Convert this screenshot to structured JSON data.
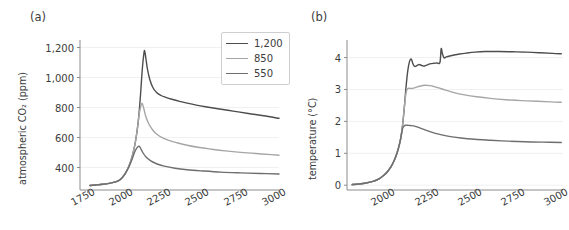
{
  "figure": {
    "panels": [
      {
        "tag": "(a)",
        "ylabel": "atmospheric CO₂ (ppm)",
        "xlabel": ""
      },
      {
        "tag": "(b)",
        "ylabel": "temperature (°C)",
        "xlabel": ""
      }
    ]
  },
  "legend": {
    "entries": [
      {
        "label": "1,200",
        "color": "#4d4d4d"
      },
      {
        "label": "850",
        "color": "#a6a6a6"
      },
      {
        "label": "550",
        "color": "#6e6e6e"
      }
    ]
  },
  "colors": {
    "series_1200": "#4d4d4d",
    "series_850": "#a6a6a6",
    "series_550": "#6e6e6e",
    "axis": "#8c8c8c",
    "grid": "#f0f0f0",
    "text": "#3c3c3c",
    "background": "#ffffff"
  },
  "chart_data": [
    {
      "type": "line",
      "panel": "(a)",
      "title": "",
      "xlabel": "",
      "ylabel": "atmospheric CO2 (ppm)",
      "xlim": [
        1700,
        3000
      ],
      "ylim": [
        250,
        1250
      ],
      "xticks": [
        1750,
        2000,
        2250,
        2500,
        2750,
        3000
      ],
      "yticks": [
        400,
        600,
        800,
        1000,
        1200
      ],
      "ytick_labels": [
        "400",
        "600",
        "800",
        "1,000",
        "1,200"
      ],
      "xtick_labels": [
        "1750",
        "2000",
        "2250",
        "2500",
        "2750",
        "3000"
      ],
      "grid": true,
      "legend_position": "upper right",
      "series": [
        {
          "name": "1,200",
          "color": "#4d4d4d",
          "x": [
            1765,
            1800,
            1850,
            1900,
            1950,
            1980,
            2000,
            2020,
            2040,
            2060,
            2080,
            2095,
            2105,
            2115,
            2122,
            2130,
            2140,
            2155,
            2175,
            2200,
            2230,
            2260,
            2300,
            2350,
            2400,
            2460,
            2520,
            2600,
            2700,
            2800,
            2900,
            3000
          ],
          "y": [
            280,
            283,
            288,
            296,
            311,
            338,
            368,
            410,
            470,
            560,
            700,
            880,
            1030,
            1140,
            1180,
            1130,
            1060,
            990,
            935,
            900,
            880,
            868,
            855,
            841,
            829,
            816,
            805,
            792,
            776,
            760,
            745,
            728
          ]
        },
        {
          "name": "850",
          "color": "#a6a6a6",
          "x": [
            1765,
            1800,
            1850,
            1900,
            1950,
            1980,
            2000,
            2020,
            2040,
            2060,
            2075,
            2085,
            2095,
            2105,
            2115,
            2130,
            2150,
            2175,
            2200,
            2240,
            2280,
            2330,
            2400,
            2480,
            2560,
            2650,
            2750,
            2850,
            2950,
            3000
          ],
          "y": [
            280,
            283,
            288,
            296,
            311,
            338,
            368,
            410,
            470,
            560,
            660,
            745,
            800,
            828,
            800,
            740,
            690,
            650,
            623,
            597,
            581,
            566,
            548,
            533,
            522,
            511,
            501,
            493,
            486,
            482
          ]
        },
        {
          "name": "550",
          "color": "#6e6e6e",
          "x": [
            1765,
            1800,
            1850,
            1900,
            1950,
            1980,
            2000,
            2020,
            2040,
            2055,
            2068,
            2078,
            2086,
            2095,
            2110,
            2130,
            2160,
            2200,
            2250,
            2320,
            2400,
            2500,
            2620,
            2750,
            2880,
            3000
          ],
          "y": [
            280,
            283,
            288,
            296,
            311,
            338,
            368,
            405,
            455,
            498,
            525,
            538,
            542,
            530,
            500,
            472,
            446,
            425,
            409,
            395,
            385,
            377,
            369,
            364,
            360,
            357
          ]
        }
      ]
    },
    {
      "type": "line",
      "panel": "(b)",
      "title": "",
      "xlabel": "",
      "ylabel": "temperature (°C)",
      "xlim": [
        1760,
        3010
      ],
      "ylim": [
        -0.15,
        4.55
      ],
      "xticks": [
        2000,
        2250,
        2500,
        2750,
        3000
      ],
      "yticks": [
        0,
        1,
        2,
        3,
        4
      ],
      "ytick_labels": [
        "0",
        "1",
        "2",
        "3",
        "4"
      ],
      "xtick_labels": [
        "2000",
        "2250",
        "2500",
        "2750",
        "3000"
      ],
      "grid": true,
      "legend_position": "none",
      "series": [
        {
          "name": "1,200",
          "color": "#4d4d4d",
          "x": [
            1790,
            1830,
            1870,
            1910,
            1945,
            1975,
            1995,
            2015,
            2035,
            2050,
            2062,
            2072,
            2082,
            2092,
            2102,
            2112,
            2122,
            2132,
            2142,
            2152,
            2162,
            2175,
            2190,
            2205,
            2220,
            2240,
            2262,
            2282,
            2298,
            2305,
            2312,
            2322,
            2335,
            2355,
            2380,
            2410,
            2450,
            2500,
            2560,
            2640,
            2720,
            2800,
            2880,
            2950,
            3000
          ],
          "y": [
            0.02,
            0.04,
            0.07,
            0.12,
            0.2,
            0.32,
            0.43,
            0.58,
            0.8,
            1.02,
            1.25,
            1.5,
            1.9,
            2.45,
            3.1,
            3.6,
            3.88,
            3.95,
            3.8,
            3.72,
            3.74,
            3.78,
            3.76,
            3.73,
            3.76,
            3.8,
            3.82,
            3.83,
            3.85,
            4.28,
            4.12,
            3.99,
            4.02,
            4.05,
            4.08,
            4.11,
            4.14,
            4.17,
            4.19,
            4.19,
            4.18,
            4.17,
            4.15,
            4.13,
            4.12
          ]
        },
        {
          "name": "850",
          "color": "#a6a6a6",
          "x": [
            1790,
            1830,
            1870,
            1910,
            1945,
            1975,
            1995,
            2015,
            2035,
            2050,
            2062,
            2072,
            2082,
            2092,
            2102,
            2110,
            2120,
            2135,
            2155,
            2180,
            2210,
            2240,
            2265,
            2290,
            2330,
            2380,
            2440,
            2510,
            2590,
            2680,
            2770,
            2860,
            2940,
            3000
          ],
          "y": [
            0.02,
            0.04,
            0.07,
            0.12,
            0.2,
            0.32,
            0.43,
            0.58,
            0.8,
            1.02,
            1.25,
            1.5,
            1.9,
            2.45,
            2.9,
            3.02,
            3.04,
            3.03,
            3.06,
            3.1,
            3.13,
            3.12,
            3.09,
            3.05,
            2.98,
            2.9,
            2.83,
            2.77,
            2.72,
            2.68,
            2.65,
            2.63,
            2.61,
            2.6
          ]
        },
        {
          "name": "550",
          "color": "#6e6e6e",
          "x": [
            1790,
            1830,
            1870,
            1910,
            1945,
            1975,
            1995,
            2015,
            2035,
            2050,
            2062,
            2072,
            2082,
            2092,
            2100,
            2110,
            2125,
            2145,
            2170,
            2200,
            2240,
            2290,
            2350,
            2420,
            2500,
            2590,
            2690,
            2790,
            2890,
            3000
          ],
          "y": [
            0.02,
            0.04,
            0.07,
            0.12,
            0.2,
            0.32,
            0.43,
            0.58,
            0.8,
            1.02,
            1.25,
            1.5,
            1.78,
            1.86,
            1.88,
            1.88,
            1.87,
            1.86,
            1.82,
            1.76,
            1.68,
            1.6,
            1.53,
            1.48,
            1.44,
            1.41,
            1.38,
            1.36,
            1.35,
            1.34
          ]
        }
      ]
    }
  ]
}
